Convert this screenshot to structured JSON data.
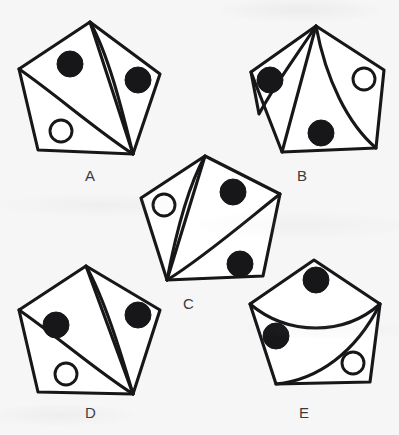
{
  "page": {
    "background_color": "#f6f6f6",
    "ink_color": "#17171a",
    "figure_fill_color": "#ffffff",
    "label_color": "#3a3a3e",
    "width": 399,
    "height": 435
  },
  "figures": [
    {
      "id": "A",
      "label": "A",
      "label_x": 85,
      "label_y": 168,
      "origin_x": 14,
      "origin_y": 18,
      "width": 152,
      "height": 140,
      "divider_origin": "bottom-right-vertex",
      "divider_count": 3,
      "black_circle_count": 2,
      "white_circle_count": 1,
      "black_circles": [
        {
          "position": "upper-left",
          "cx": 56,
          "cy": 46,
          "r": 13
        },
        {
          "position": "upper-right",
          "cx": 124,
          "cy": 62,
          "r": 13
        }
      ],
      "white_circles": [
        {
          "position": "lower-left",
          "cx": 47,
          "cy": 113,
          "r": 11
        }
      ]
    },
    {
      "id": "B",
      "label": "B",
      "label_x": 297,
      "label_y": 168,
      "origin_x": 238,
      "origin_y": 22,
      "width": 150,
      "height": 138,
      "divider_origin": "top-vertex",
      "divider_count": 3,
      "black_circle_count": 2,
      "white_circle_count": 1,
      "black_circles": [
        {
          "position": "upper-left",
          "cx": 32,
          "cy": 58,
          "r": 13
        },
        {
          "position": "lower-middle",
          "cx": 83,
          "cy": 111,
          "r": 13
        }
      ],
      "white_circles": [
        {
          "position": "upper-right",
          "cx": 126,
          "cy": 57,
          "r": 11
        }
      ]
    },
    {
      "id": "C",
      "label": "C",
      "label_x": 183,
      "label_y": 296,
      "origin_x": 135,
      "origin_y": 152,
      "width": 150,
      "height": 140,
      "divider_origin": "bottom-left-vertex",
      "divider_count": 3,
      "black_circle_count": 2,
      "white_circle_count": 1,
      "black_circles": [
        {
          "position": "upper-right",
          "cx": 98,
          "cy": 40,
          "r": 13
        },
        {
          "position": "lower-right",
          "cx": 105,
          "cy": 112,
          "r": 13
        }
      ],
      "white_circles": [
        {
          "position": "upper-left",
          "cx": 29,
          "cy": 53,
          "r": 11
        }
      ]
    },
    {
      "id": "D",
      "label": "D",
      "label_x": 85,
      "label_y": 405,
      "origin_x": 14,
      "origin_y": 262,
      "width": 152,
      "height": 140,
      "divider_origin": "bottom-right-vertex",
      "divider_count": 3,
      "black_circle_count": 2,
      "white_circle_count": 1,
      "black_circles": [
        {
          "position": "left",
          "cx": 42,
          "cy": 63,
          "r": 13
        },
        {
          "position": "upper-right",
          "cx": 124,
          "cy": 53,
          "r": 13
        }
      ],
      "white_circles": [
        {
          "position": "lower-left",
          "cx": 52,
          "cy": 112,
          "r": 11
        }
      ]
    },
    {
      "id": "E",
      "label": "E",
      "label_x": 299,
      "label_y": 405,
      "origin_x": 240,
      "origin_y": 256,
      "width": 150,
      "height": 136,
      "divider_origin": "side-vertices",
      "divider_count": 2,
      "black_circle_count": 2,
      "white_circle_count": 1,
      "black_circles": [
        {
          "position": "top",
          "cx": 76,
          "cy": 24,
          "r": 13
        },
        {
          "position": "left",
          "cx": 36,
          "cy": 80,
          "r": 13
        }
      ],
      "white_circles": [
        {
          "position": "lower-right",
          "cx": 113,
          "cy": 107,
          "r": 11
        }
      ]
    }
  ]
}
